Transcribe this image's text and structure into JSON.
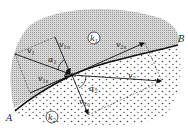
{
  "diagram": {
    "type": "vector refraction at boundary",
    "regions": [
      {
        "id": "k1",
        "label": "k",
        "sub": "1",
        "fill": "#c9c9c9"
      },
      {
        "id": "k2",
        "label": "k",
        "sub": "2",
        "fill": "#ffffff"
      }
    ],
    "boundary": {
      "start_label": "A",
      "end_label": "B"
    },
    "vectors": [
      {
        "id": "v1",
        "label": "v",
        "sub": "1"
      },
      {
        "id": "v1n",
        "label": "v",
        "sub": "1n"
      },
      {
        "id": "v1s",
        "label": "v",
        "sub": "1s"
      },
      {
        "id": "v2",
        "label": "v",
        "sub": "2"
      },
      {
        "id": "v2n",
        "label": "v",
        "sub": "2n"
      },
      {
        "id": "v2s",
        "label": "v",
        "sub": "2s"
      }
    ],
    "angles": [
      {
        "id": "alpha1",
        "label": "α",
        "sub": "1"
      },
      {
        "id": "alpha2",
        "label": "α",
        "sub": "2"
      }
    ]
  }
}
